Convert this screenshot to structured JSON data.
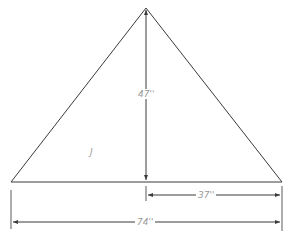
{
  "diagram": {
    "type": "triangle-dimension-drawing",
    "labels": {
      "height": "47''",
      "half_base": "37''",
      "base": "74''",
      "interior_mark": "J"
    },
    "colors": {
      "line": "#3a3a3a",
      "dimension_text": "#9a9a9a",
      "background": "#ffffff"
    }
  }
}
